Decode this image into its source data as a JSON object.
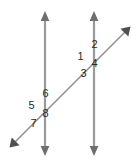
{
  "figure": {
    "name": "parallel-lines-transversal-angles",
    "background_color": "#ffffff",
    "line_color": "#9a9a9a",
    "transversal_color": "#8c8c8c",
    "label_color": "#2b2b2b",
    "lines": [
      {
        "name": "left-parallel-line",
        "orientation": "vertical",
        "x1": 45,
        "y1": 16,
        "x2": 45,
        "y2": 150,
        "arrow_start": true,
        "arrow_end": true
      },
      {
        "name": "right-parallel-line",
        "orientation": "vertical",
        "x1": 94,
        "y1": 16,
        "x2": 94,
        "y2": 150,
        "arrow_start": true,
        "arrow_end": true
      },
      {
        "name": "transversal-line",
        "orientation": "diagonal",
        "x1": 14,
        "y1": 143,
        "x2": 126,
        "y2": 31,
        "arrow_start": true,
        "arrow_end": true
      }
    ],
    "intersections": [
      {
        "name": "upper-right-intersection",
        "x": 94,
        "y": 63
      },
      {
        "name": "lower-left-intersection",
        "x": 45,
        "y": 112
      }
    ],
    "angle_labels": [
      {
        "id": "angle-1",
        "text": "1",
        "x": 80,
        "y": 51,
        "position": "left-of-upper-intersection"
      },
      {
        "id": "angle-2",
        "text": "2",
        "x": 94,
        "y": 39,
        "position": "above-right-of-upper-intersection"
      },
      {
        "id": "angle-3",
        "text": "3",
        "x": 83,
        "y": 68,
        "position": "below-left-of-upper-intersection"
      },
      {
        "id": "angle-4",
        "text": "4",
        "x": 94,
        "y": 58,
        "position": "right-of-upper-intersection"
      },
      {
        "id": "angle-5",
        "text": "5",
        "x": 31,
        "y": 100,
        "position": "left-of-lower-intersection"
      },
      {
        "id": "angle-6",
        "text": "6",
        "x": 45,
        "y": 88,
        "position": "above-right-of-lower-intersection"
      },
      {
        "id": "angle-7",
        "text": "7",
        "x": 33,
        "y": 118,
        "position": "below-left-of-lower-intersection"
      },
      {
        "id": "angle-8",
        "text": "8",
        "x": 45,
        "y": 108,
        "position": "right-of-lower-intersection"
      }
    ]
  }
}
